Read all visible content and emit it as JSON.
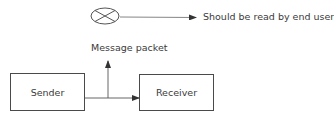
{
  "diagram": {
    "nodes": {
      "sender": {
        "label": "Sender"
      },
      "receiver": {
        "label": "Receiver"
      },
      "end_symbol": {
        "label": "Should be read by end user",
        "shape": "crossed-circle"
      }
    },
    "labels": {
      "message_packet": "Message packet"
    },
    "edges": [
      {
        "from": "sender",
        "to": "receiver"
      },
      {
        "from": "sender-receiver-line",
        "to": "message_packet"
      },
      {
        "from": "end_symbol",
        "to": "end_symbol_label"
      }
    ],
    "colors": {
      "stroke": "#4a4a4a",
      "text": "#3a3a3a"
    }
  }
}
